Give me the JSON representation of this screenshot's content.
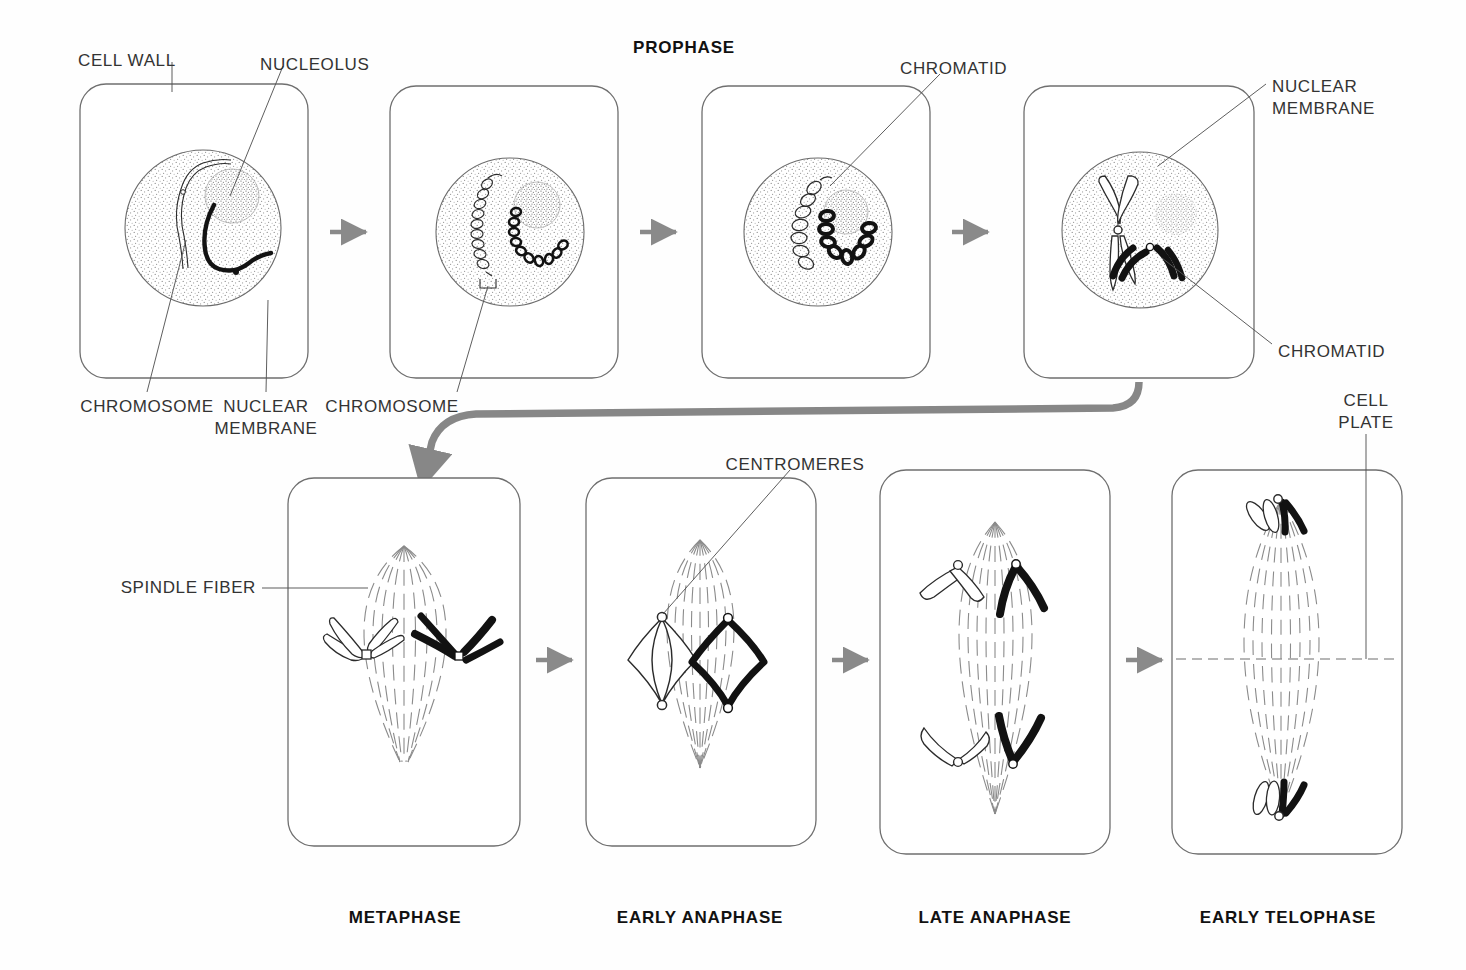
{
  "diagram": {
    "title_top": "PROPHASE",
    "row1": {
      "panels": [
        {
          "id": "prophase-1",
          "cx": 203,
          "cy": 232,
          "stage": "early-prophase"
        },
        {
          "id": "prophase-2",
          "cx": 510,
          "cy": 232,
          "stage": "mid-prophase"
        },
        {
          "id": "prophase-3",
          "cx": 818,
          "cy": 232,
          "stage": "late-prophase"
        },
        {
          "id": "prophase-4",
          "cx": 1140,
          "cy": 232,
          "stage": "end-prophase"
        }
      ]
    },
    "row2": {
      "panels": [
        {
          "id": "metaphase",
          "cx": 400,
          "cy": 668,
          "label": "METAPHASE"
        },
        {
          "id": "early-anaphase",
          "cx": 700,
          "cy": 668,
          "label": "EARLY ANAPHASE"
        },
        {
          "id": "late-anaphase",
          "cx": 995,
          "cy": 668,
          "label": "LATE ANAPHASE"
        },
        {
          "id": "early-telophase",
          "cx": 1288,
          "cy": 668,
          "label": "EARLY TELOPHASE"
        }
      ]
    },
    "labels": {
      "cell_wall": "CELL WALL",
      "nucleolus": "NUCLEOLUS",
      "chromatid_top": "CHROMATID",
      "nuclear_membrane_right_line1": "NUCLEAR",
      "nuclear_membrane_right_line2": "MEMBRANE",
      "chromatid_right": "CHROMATID",
      "chromosome_left": "CHROMOSOME",
      "nuclear_membrane_line1": "NUCLEAR",
      "nuclear_membrane_line2": "MEMBRANE",
      "chromosome_mid": "CHROMOSOME",
      "spindle_fiber": "SPINDLE FIBER",
      "centromeres": "CENTROMERES",
      "cell_plate_line1": "CELL",
      "cell_plate_line2": "PLATE"
    },
    "phase_labels": {
      "metaphase": "METAPHASE",
      "early_anaphase": "EARLY ANAPHASE",
      "late_anaphase": "LATE ANAPHASE",
      "early_telophase": "EARLY TELOPHASE"
    },
    "colors": {
      "ink": "#2b2b2b",
      "panel_stroke": "#6f6f6f",
      "arrow_gray": "#8a8a8a",
      "big_arrow_gray": "#878787",
      "stipple": "#7a7a7a",
      "chromosome_dark": "#121212",
      "background": "#ffffff"
    },
    "arrows": {
      "row1": [
        {
          "x": 340,
          "y": 232
        },
        {
          "x": 648,
          "y": 232
        },
        {
          "x": 960,
          "y": 232
        }
      ],
      "row2": [
        {
          "x": 548,
          "y": 660
        },
        {
          "x": 845,
          "y": 660
        },
        {
          "x": 1140,
          "y": 660
        }
      ],
      "connector": "curved-flow-arrow-row1-to-row2"
    }
  }
}
